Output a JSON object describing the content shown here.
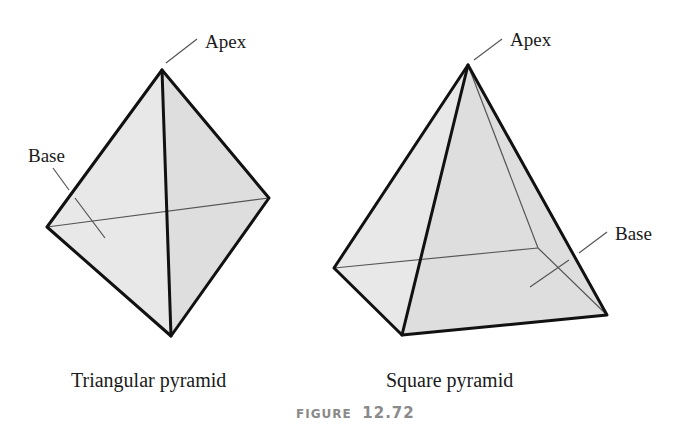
{
  "figure": {
    "number_prefix": "Figure",
    "number": "12.72",
    "colors": {
      "face_fill": "#e6e6e6",
      "face_fill_dark": "#dcdcdc",
      "edge": "#111111",
      "hidden_edge": "#555555",
      "figure_number": "#8a8a8a"
    }
  },
  "triangular_pyramid": {
    "caption": "Triangular pyramid",
    "apex_label": "Apex",
    "base_label": "Base",
    "vertices": {
      "apex": [
        162,
        70
      ],
      "left": [
        47,
        227
      ],
      "right": [
        269,
        198
      ],
      "front": [
        171,
        336
      ]
    }
  },
  "square_pyramid": {
    "caption": "Square pyramid",
    "apex_label": "Apex",
    "base_label": "Base",
    "vertices": {
      "apex": [
        468,
        65
      ],
      "left": [
        334,
        268
      ],
      "front": [
        402,
        335
      ],
      "right": [
        607,
        315
      ],
      "back": [
        538,
        248
      ]
    }
  }
}
